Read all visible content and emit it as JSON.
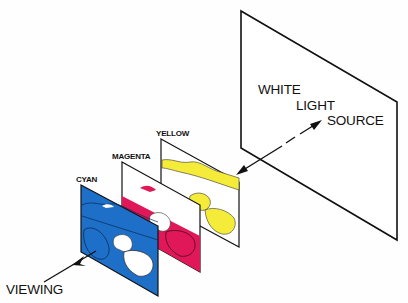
{
  "diagram": {
    "labels": {
      "source_line1": "WHITE",
      "source_line2": "LIGHT",
      "source_line3": "SOURCE",
      "yellow": "YELLOW",
      "magenta": "MAGENTA",
      "cyan": "CYAN",
      "viewing": "VIEWING"
    },
    "colors": {
      "cyan_layer": "#1E6FC8",
      "magenta_layer": "#E0185A",
      "yellow_layer": "#F5EC3A",
      "line": "#111111",
      "background": "#FEFEFE"
    },
    "layers": [
      {
        "name": "White light source",
        "order": 1
      },
      {
        "name": "Yellow",
        "order": 2
      },
      {
        "name": "Magenta",
        "order": 3
      },
      {
        "name": "Cyan",
        "order": 4
      }
    ],
    "arrows": [
      {
        "from": "white light source",
        "to": "yellow layer",
        "style": "dashed then solid"
      },
      {
        "from": "cyan layer",
        "to": "viewing",
        "style": "solid"
      }
    ]
  }
}
